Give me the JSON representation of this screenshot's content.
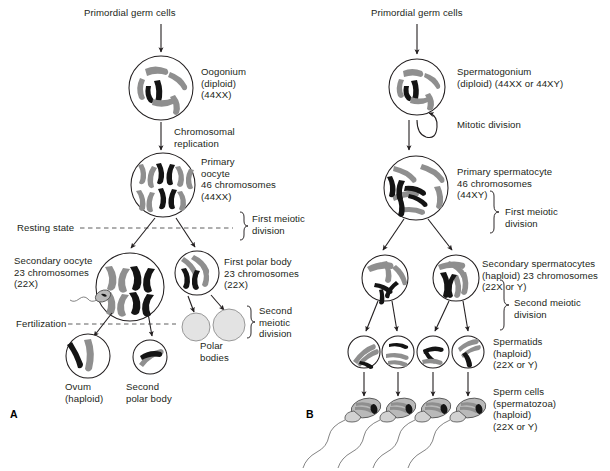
{
  "figure": {
    "type": "biology-diagram",
    "panel_a_id": "A",
    "panel_b_id": "B",
    "colors": {
      "chromosome_maternal": "#8f8f8f",
      "chromosome_paternal": "#141414",
      "cell_outline": "#231f20",
      "polar_body_fill": "#e3e3e3",
      "text": "#231f20",
      "background": "#ffffff"
    }
  },
  "panel_a": {
    "title_source": "Primordial germ cells",
    "cells": [
      {
        "name": "oogonium",
        "label": "Oogonium\n(diploid)\n(44XX)"
      },
      {
        "name": "primary-oocyte",
        "label": "Primary\noocyte\n46 chromosomes\n(44XX)"
      },
      {
        "name": "secondary-oocyte",
        "label": "Secondary oocyte\n23 chromosomes\n(22X)"
      },
      {
        "name": "first-polar-body",
        "label": "First polar body\n23 chromosomes\n(22X)"
      },
      {
        "name": "ovum",
        "label": "Ovum\n(haploid)"
      },
      {
        "name": "second-polar-body",
        "label": "Second\npolar body"
      },
      {
        "name": "polar-bodies",
        "label": "Polar\nbodies"
      }
    ],
    "process_labels": [
      {
        "name": "chromosomal-replication",
        "label": "Chromosomal\nreplication"
      },
      {
        "name": "resting-state",
        "label": "Resting state"
      },
      {
        "name": "first-meiotic-division",
        "label": "First meiotic\ndivision"
      },
      {
        "name": "fertilization",
        "label": "Fertilization"
      },
      {
        "name": "second-meiotic-division",
        "label": "Second\nmeiotic\ndivision"
      }
    ]
  },
  "panel_b": {
    "title_source": "Primordial germ cells",
    "cells": [
      {
        "name": "spermatogonium",
        "label": "Spermatogonium\n(diploid) (44XX or 44XY)"
      },
      {
        "name": "primary-spermatocyte",
        "label": "Primary spermatocyte\n46 chromosomes\n(44XY)"
      },
      {
        "name": "secondary-spermatocytes",
        "label": "Secondary spermatocytes\n(haploid) 23 chromosomes\n(22X or Y)"
      },
      {
        "name": "spermatids",
        "label": "Spermatids\n(haploid)\n(22X or Y)"
      },
      {
        "name": "sperm-cells",
        "label": "Sperm cells\n(spermatozoa)\n(haploid)\n(22X or Y)"
      }
    ],
    "process_labels": [
      {
        "name": "mitotic-division",
        "label": "Mitotic division"
      },
      {
        "name": "first-meiotic-division",
        "label": "First meiotic\ndivision"
      },
      {
        "name": "second-meiotic-division",
        "label": "Second meiotic\ndivision"
      }
    ]
  }
}
